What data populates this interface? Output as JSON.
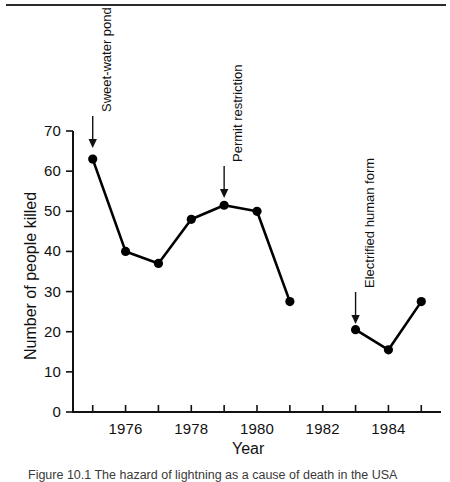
{
  "figure": {
    "has_top_rule": true,
    "caption_partial": "Figure 10.1    The hazard of lightning as a cause of death in the USA",
    "background": "#ffffff",
    "ink_color": "#111111"
  },
  "chart_data": {
    "type": "line",
    "title": "",
    "xlabel": "Year",
    "ylabel": "Number of people killed",
    "xlim": [
      1974.4,
      1985.6
    ],
    "ylim": [
      0,
      70
    ],
    "grid": false,
    "legend": "none",
    "x_tick_values": [
      1975,
      1976,
      1977,
      1978,
      1979,
      1980,
      1981,
      1982,
      1983,
      1984,
      1985
    ],
    "x_tick_labels": [
      "",
      "1976",
      "",
      "1978",
      "",
      "1980",
      "",
      "1982",
      "",
      "1984",
      ""
    ],
    "y_tick_values": [
      0,
      10,
      20,
      30,
      40,
      50,
      60,
      70
    ],
    "y_tick_labels": [
      "0",
      "10",
      "20",
      "30",
      "40",
      "50",
      "60",
      "70"
    ],
    "series": [
      {
        "name": "segment-1",
        "x": [
          1975,
          1976,
          1977,
          1978,
          1979,
          1980,
          1981
        ],
        "values": [
          63,
          40,
          37,
          48,
          51.5,
          50,
          27.5
        ]
      },
      {
        "name": "segment-2",
        "x": [
          1983,
          1984,
          1985
        ],
        "values": [
          20.5,
          15.5,
          27.5
        ]
      }
    ],
    "annotations": [
      {
        "label": "Sweet-water pond",
        "x": 1975,
        "y": 63,
        "label_top": 14,
        "arrow_from_y": 116,
        "arrow_to_y": 148
      },
      {
        "label": "Permit restriction",
        "x": 1979,
        "y": 51.5,
        "label_top": 64,
        "arrow_from_y": 166,
        "arrow_to_y": 198
      },
      {
        "label": "Electrified human form",
        "x": 1983,
        "y": 20.5,
        "label_top": 154,
        "arrow_from_y": 292,
        "arrow_to_y": 324
      }
    ]
  }
}
